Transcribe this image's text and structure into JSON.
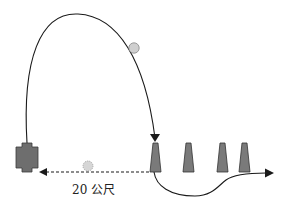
{
  "diagram": {
    "distance_label": "20 公尺",
    "colors": {
      "line": "#1a1a1a",
      "cone_fill": "#7a7a7a",
      "player_fill": "#6e6e6e",
      "ball_fill": "#cfcfcf",
      "ball_stroke": "#888888"
    },
    "elements": {
      "player": "cross-shaped player marker (left)",
      "cones": 4,
      "balls": 2,
      "paths": [
        "high arc pass from player to first cone",
        "dashed ground pass back to player",
        "dribble path under cones to exit arrow"
      ]
    }
  }
}
